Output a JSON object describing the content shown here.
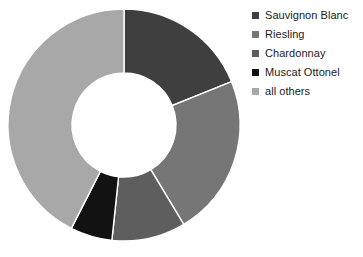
{
  "chart_data": {
    "type": "pie",
    "variant": "donut",
    "title": "",
    "subtitle": "",
    "xlabel": "",
    "ylabel": "",
    "grid": false,
    "legend_position": "right",
    "start_angle_deg": 0,
    "direction": "clockwise",
    "inner_radius_ratio": 0.45,
    "categories": [
      "Sauvignon Blanc",
      "Riesling",
      "Chardonnay",
      "Muscat Ottonel",
      "all others"
    ],
    "values": [
      18.9,
      22.5,
      10.3,
      5.8,
      42.5
    ],
    "unit": "percent",
    "colors": [
      "#3f3f3f",
      "#767676",
      "#5e5e5e",
      "#121212",
      "#a8a8a8"
    ],
    "slices": [
      {
        "label": "Sauvignon Blanc",
        "value": 18.9,
        "color": "#3f3f3f",
        "start_deg": 0,
        "end_deg": 68
      },
      {
        "label": "Riesling",
        "value": 22.5,
        "color": "#767676",
        "start_deg": 68,
        "end_deg": 149
      },
      {
        "label": "Chardonnay",
        "value": 10.3,
        "color": "#5e5e5e",
        "start_deg": 149,
        "end_deg": 186
      },
      {
        "label": "Muscat Ottonel",
        "value": 5.8,
        "color": "#121212",
        "start_deg": 186,
        "end_deg": 207
      },
      {
        "label": "all others",
        "value": 42.5,
        "color": "#a8a8a8",
        "start_deg": 207,
        "end_deg": 360
      }
    ]
  },
  "legend": {
    "items": [
      {
        "label": "Sauvignon Blanc",
        "color": "#3f3f3f",
        "marker": "square-marker"
      },
      {
        "label": "Riesling",
        "color": "#767676",
        "marker": "square-marker"
      },
      {
        "label": "Chardonnay",
        "color": "#5e5e5e",
        "marker": "square-marker"
      },
      {
        "label": "Muscat Ottonel",
        "color": "#121212",
        "marker": "square-marker"
      },
      {
        "label": "all others",
        "color": "#a8a8a8",
        "marker": "square-marker"
      }
    ]
  },
  "canvas": {
    "background": "#ffffff",
    "center_x": 116,
    "center_y": 116,
    "outer_radius": 116,
    "inner_radius": 52
  }
}
